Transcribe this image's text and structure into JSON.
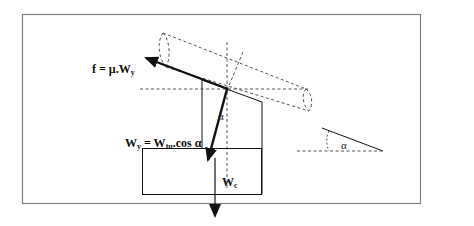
{
  "figure": {
    "colors": {
      "frame": "#808080",
      "line": "#111111",
      "dashed": "#555555",
      "background": "#ffffff"
    }
  },
  "labels": {
    "friction": {
      "main": "f = μ.W",
      "sub": "y"
    },
    "weight_component": {
      "w": "W",
      "w_sub": "y",
      "eq": " = W",
      "eq_sub": "tu",
      "rest": ".cos α"
    },
    "angle_main": "α",
    "weight_c": {
      "main": "W",
      "sub": "c"
    },
    "angle_inset": "α"
  }
}
